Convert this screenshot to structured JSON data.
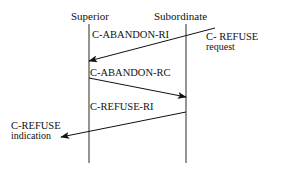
{
  "diagram": {
    "type": "sequence-diagram",
    "background_color": "#ffffff",
    "line_color": "#1a1a1a",
    "lifeline_color": "#555555",
    "participants": [
      {
        "id": "superior",
        "label": "Superior",
        "x": 89
      },
      {
        "id": "subordinate",
        "label": "Subordinate",
        "x": 186
      }
    ],
    "messages": [
      {
        "id": "m1",
        "label": "C-ABANDON-RI",
        "from": "subordinate",
        "to": "superior",
        "direction": "right-to-left",
        "x1": 215,
        "y1": 28,
        "x2": 89,
        "y2": 61
      },
      {
        "id": "m2",
        "label": "C-ABANDON-RC",
        "from": "superior",
        "to": "subordinate",
        "direction": "left-to-right",
        "x1": 89,
        "y1": 78,
        "x2": 186,
        "y2": 97
      },
      {
        "id": "m3",
        "label": "C-REFUSE-RI",
        "from": "subordinate",
        "to": "superior",
        "direction": "right-to-left",
        "x1": 186,
        "y1": 112,
        "x2": 61,
        "y2": 137
      }
    ],
    "notes": [
      {
        "id": "note-request",
        "line1": "C- REFUSE",
        "line2": "request",
        "side": "right"
      },
      {
        "id": "note-indication",
        "line1": "C-REFUSE",
        "line2": "indication",
        "side": "left"
      }
    ]
  }
}
